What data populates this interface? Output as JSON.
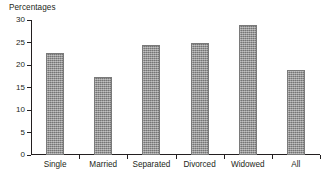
{
  "chart_data": {
    "type": "bar",
    "title": "Percentages",
    "xlabel": "",
    "ylabel": "",
    "categories": [
      "Single",
      "Married",
      "Separated",
      "Divorced",
      "Widowed",
      "All"
    ],
    "values": [
      22.7,
      17.4,
      24.5,
      24.9,
      29.0,
      19.0
    ],
    "ylim": [
      0,
      30
    ],
    "yticks": [
      0,
      5,
      10,
      15,
      20,
      25,
      30
    ],
    "ytick_labels": [
      "0",
      "5",
      "10",
      "15",
      "20",
      "25",
      "30"
    ],
    "grid": false,
    "legend": false,
    "series": [
      {
        "name": "Percentages",
        "values": [
          22.7,
          17.4,
          24.5,
          24.9,
          29.0,
          19.0
        ]
      }
    ],
    "bar_color": "#8d8d8d",
    "axis_color": "#231f20",
    "background_color": "#ffffff"
  }
}
